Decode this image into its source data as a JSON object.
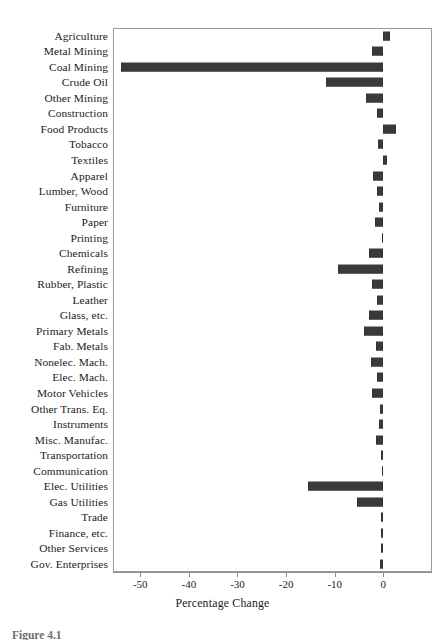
{
  "chart_data": {
    "type": "bar",
    "orientation": "horizontal",
    "title": "",
    "xlabel": "Percentage Change",
    "ylabel": "",
    "xlim": [
      -55.6,
      10.0
    ],
    "xticks": [
      -50,
      -40,
      -30,
      -20,
      -10,
      0
    ],
    "xtick_labels": [
      "-50",
      "-40",
      "-30",
      "-20",
      "-10",
      "0"
    ],
    "grid": false,
    "legend": null,
    "bar_color": "#3a3a3a",
    "frame_color": "#9a9a9a",
    "categories": [
      "Agriculture",
      "Metal Mining",
      "Coal Mining",
      "Crude Oil",
      "Other Mining",
      "Construction",
      "Food Products",
      "Tobacco",
      "Textiles",
      "Apparel",
      "Lumber, Wood",
      "Furniture",
      "Paper",
      "Printing",
      "Chemicals",
      "Refining",
      "Rubber, Plastic",
      "Leather",
      "Glass, etc.",
      "Primary Metals",
      "Fab. Metals",
      "Nonelec. Mach.",
      "Elec. Mach.",
      "Motor Vehicles",
      "Other Trans. Eq.",
      "Instruments",
      "Misc. Manufac.",
      "Transportation",
      "Communication",
      "Elec. Utilities",
      "Gas Utilities",
      "Trade",
      "Finance, etc.",
      "Other Services",
      "Gov. Enterprises"
    ],
    "values": [
      1.3,
      -2.3,
      -53.9,
      -11.8,
      -3.5,
      -1.3,
      2.5,
      -1.1,
      0.8,
      -2.2,
      -1.3,
      -1.0,
      -1.8,
      -0.2,
      -3.0,
      -9.3,
      -2.4,
      -1.4,
      -2.9,
      -4.0,
      -1.5,
      -2.6,
      -1.4,
      -2.4,
      -0.6,
      -1.0,
      -1.6,
      -0.5,
      -0.3,
      -15.4,
      -5.5,
      -0.4,
      -0.4,
      -0.5,
      -0.7
    ]
  },
  "caption": "Figure 4.1"
}
